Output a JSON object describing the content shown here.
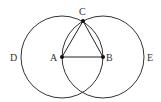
{
  "diagram": {
    "title": "",
    "stroke_color": "#333333",
    "circles": [
      {
        "name": "circle-A",
        "center": "A",
        "cx": 62,
        "cy": 57,
        "r": 41
      },
      {
        "name": "circle-B",
        "center": "B",
        "cx": 103,
        "cy": 57,
        "r": 41
      }
    ],
    "points": [
      {
        "label": "A",
        "x": 62,
        "y": 57
      },
      {
        "label": "B",
        "x": 103,
        "y": 57
      },
      {
        "label": "C",
        "x": 83,
        "y": 21
      }
    ],
    "segments": [
      [
        "A",
        "B"
      ],
      [
        "A",
        "C"
      ],
      [
        "B",
        "C"
      ]
    ],
    "labels": {
      "A": "A",
      "B": "B",
      "C": "C",
      "D": "D",
      "E": "E"
    }
  }
}
